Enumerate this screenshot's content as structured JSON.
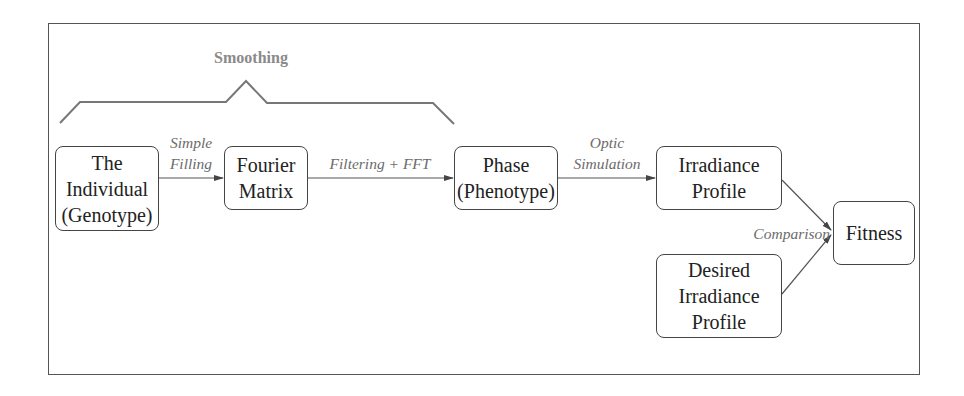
{
  "diagram": {
    "group_label": "Smoothing",
    "nodes": {
      "individual": [
        "The",
        "Individual",
        "(Genotype)"
      ],
      "fourier": [
        "Fourier",
        "Matrix"
      ],
      "phase": [
        "Phase",
        "(Phenotype)"
      ],
      "irradiance": [
        "Irradiance",
        "Profile"
      ],
      "desired": [
        "Desired",
        "Irradiance",
        "Profile"
      ],
      "fitness": [
        "Fitness"
      ]
    },
    "edges": {
      "simple_filling": [
        "Simple",
        "Filling"
      ],
      "filtering_fft": "Filtering + FFT",
      "optic_simulation": [
        "Optic",
        "Simulation"
      ],
      "comparison": "Comparison"
    },
    "colors": {
      "box_border": "#444444",
      "node_text": "#222222",
      "edge_label": "#6b6b6b",
      "group_label": "#8a8a8a",
      "frame": "#555555"
    }
  }
}
